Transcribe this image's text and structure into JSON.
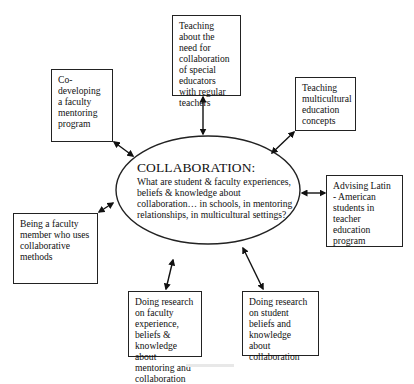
{
  "diagram": {
    "type": "concept-map",
    "center": {
      "title": "COLLABORATION:",
      "question": "What are student & faculty experiences, beliefs & knowledge about collaboration… in schools, in mentoring relationships, in multicultural settings?"
    },
    "nodes": [
      {
        "id": "teaching-collaboration",
        "label": "Teaching about the need for collaboration of special educators with regular teachers"
      },
      {
        "id": "faculty-mentoring",
        "label": "Co-developing a faculty mentoring program"
      },
      {
        "id": "multicultural",
        "label": "Teaching multicultural education concepts"
      },
      {
        "id": "advising",
        "label": "Advising Latin - American students in teacher education program"
      },
      {
        "id": "collaborative-methods",
        "label": "Being a faculty member who uses collaborative methods"
      },
      {
        "id": "research-faculty",
        "label": "Doing research on faculty experience, beliefs & knowledge about mentoring and collaboration"
      },
      {
        "id": "research-student",
        "label": "Doing research on student beliefs and knowledge about collaboration"
      }
    ],
    "edges": [
      {
        "from": "center",
        "to": "teaching-collaboration",
        "style": "double-arrow"
      },
      {
        "from": "center",
        "to": "faculty-mentoring",
        "style": "double-arrow"
      },
      {
        "from": "center",
        "to": "multicultural",
        "style": "double-arrow"
      },
      {
        "from": "center",
        "to": "advising",
        "style": "double-arrow"
      },
      {
        "from": "center",
        "to": "collaborative-methods",
        "style": "double-arrow"
      },
      {
        "from": "center",
        "to": "research-faculty",
        "style": "double-arrow"
      },
      {
        "from": "center",
        "to": "research-student",
        "style": "double-arrow"
      }
    ],
    "colors": {
      "stroke": "#222222",
      "background": "#ffffff",
      "text": "#111111"
    }
  }
}
